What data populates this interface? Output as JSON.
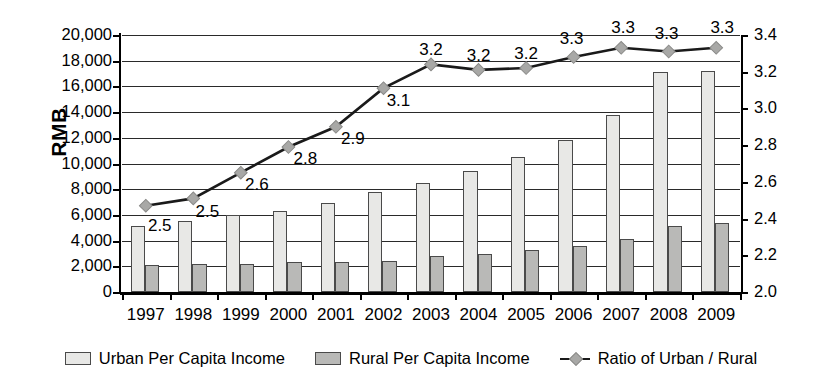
{
  "chart_data": {
    "type": "bar",
    "title": "",
    "subtitle": "",
    "xlabel": "",
    "ylabel": "RMB",
    "ylabel_secondary": "",
    "categories": [
      "1997",
      "1998",
      "1999",
      "2000",
      "2001",
      "2002",
      "2003",
      "2004",
      "2005",
      "2006",
      "2007",
      "2008",
      "2009"
    ],
    "ylim": [
      0,
      20000
    ],
    "ylim_secondary": [
      2.0,
      3.4
    ],
    "grid": true,
    "legend_position": "bottom",
    "series": [
      {
        "name": "Urban Per Capita Income",
        "type": "bar",
        "axis": "left",
        "color": "#e8e8e6",
        "values": [
          5100,
          5500,
          6000,
          6300,
          6900,
          7800,
          8500,
          9400,
          10500,
          11800,
          13800,
          17100,
          17200
        ]
      },
      {
        "name": "Rural Per Capita Income",
        "type": "bar",
        "axis": "left",
        "color": "#b9b9b7",
        "values": [
          2100,
          2150,
          2150,
          2350,
          2350,
          2450,
          2800,
          2950,
          3300,
          3550,
          4150,
          5150,
          5350
        ]
      },
      {
        "name": "Ratio of Urban / Rural",
        "type": "line",
        "axis": "right",
        "color": "#1a1a1a",
        "values": [
          2.47,
          2.51,
          2.65,
          2.79,
          2.9,
          3.11,
          3.24,
          3.21,
          3.22,
          3.28,
          3.33,
          3.31,
          3.33
        ],
        "data_labels": [
          "2.5",
          "2.5",
          "2.6",
          "2.8",
          "2.9",
          "3.1",
          "3.2",
          "3.2",
          "3.2",
          "3.3",
          "3.3",
          "3.3",
          "3.3"
        ]
      }
    ],
    "yticks_left": [
      "0",
      "2,000",
      "4,000",
      "6,000",
      "8,000",
      "10,000",
      "12,000",
      "14,000",
      "16,000",
      "18,000",
      "20,000"
    ],
    "yticks_right": [
      "2.0",
      "2.2",
      "2.4",
      "2.6",
      "2.8",
      "3.0",
      "3.2",
      "3.4"
    ]
  },
  "legend": {
    "items": [
      {
        "label": "Urban Per Capita Income",
        "marker": "square-light-swatch"
      },
      {
        "label": "Rural Per Capita Income",
        "marker": "square-dark-swatch"
      },
      {
        "label": "Ratio of Urban / Rural",
        "marker": "line-diamond-marker"
      }
    ]
  },
  "colors": {
    "urban_bar": "#e8e8e6",
    "rural_bar": "#b9b9b7",
    "bar_border": "#4a4a4a",
    "line": "#1a1a1a",
    "marker": "#a8a8a6",
    "gridline": "#2a2a2a",
    "axis": "#000000",
    "background": "#ffffff"
  }
}
